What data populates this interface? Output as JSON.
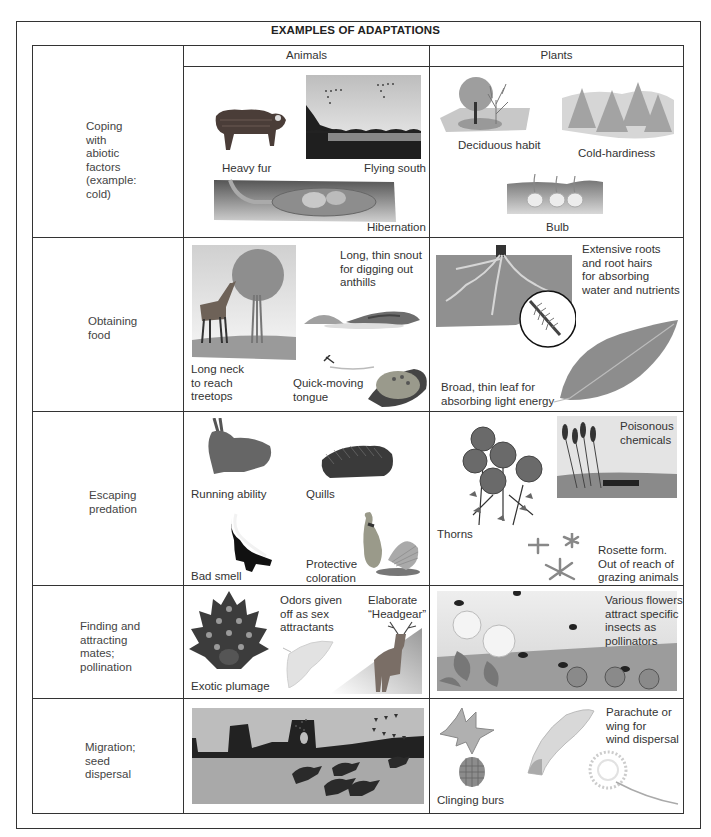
{
  "title": "EXAMPLES OF ADAPTATIONS",
  "columns": {
    "category": "",
    "animals": "Animals",
    "plants": "Plants"
  },
  "rows": [
    {
      "category": "Coping with abiotic factors (example: cold)",
      "category_lines": [
        "Coping",
        "with",
        "abiotic",
        "factors",
        "(example:",
        "cold)"
      ],
      "animals": [
        {
          "caption": "Heavy fur",
          "icon": "musk-ox-illustration"
        },
        {
          "caption": "Flying south",
          "icon": "geese-migrating-illustration"
        },
        {
          "caption": "Hibernation",
          "icon": "burrow-hibernation-illustration"
        }
      ],
      "plants": [
        {
          "caption": "Deciduous habit",
          "icon": "deciduous-trees-illustration"
        },
        {
          "caption": "Cold-hardiness",
          "icon": "conifer-trees-illustration"
        },
        {
          "caption": "Bulb",
          "icon": "bulbs-in-soil-illustration"
        }
      ]
    },
    {
      "category": "Obtaining food",
      "category_lines": [
        "Obtaining",
        "food"
      ],
      "animals": [
        {
          "caption": "Long neck to reach treetops",
          "caption_lines": [
            "Long neck",
            "to reach",
            "treetops"
          ],
          "icon": "giraffe-illustration"
        },
        {
          "caption": "Long, thin snout for digging out anthills",
          "caption_lines": [
            "Long, thin snout",
            "for digging out",
            "anthills"
          ],
          "icon": "anteater-illustration"
        },
        {
          "caption": "Quick-moving tongue",
          "caption_lines": [
            "Quick-moving",
            "tongue"
          ],
          "icon": "frog-tongue-illustration"
        }
      ],
      "plants": [
        {
          "caption": "Extensive roots and root hairs for absorbing water and nutrients",
          "caption_lines": [
            "Extensive roots",
            "and root hairs",
            "for absorbing",
            "water and nutrients"
          ],
          "icon": "roots-illustration"
        },
        {
          "caption": "Broad, thin leaf for absorbing light energy",
          "caption_lines": [
            "Broad, thin leaf for",
            "absorbing light energy"
          ],
          "icon": "leaf-illustration"
        }
      ]
    },
    {
      "category": "Escaping predation",
      "category_lines": [
        "Escaping",
        "predation"
      ],
      "animals": [
        {
          "caption": "Running ability",
          "icon": "rabbit-illustration"
        },
        {
          "caption": "Quills",
          "icon": "porcupine-illustration"
        },
        {
          "caption": "Bad smell",
          "icon": "skunk-illustration"
        },
        {
          "caption": "Protective coloration",
          "caption_lines": [
            "Protective",
            "coloration"
          ],
          "icon": "grouse-illustration"
        }
      ],
      "plants": [
        {
          "caption": "Thorns",
          "icon": "roses-illustration"
        },
        {
          "caption": "Poisonous chemicals",
          "caption_lines": [
            "Poisonous",
            "chemicals"
          ],
          "icon": "cattails-illustration"
        },
        {
          "caption": "Rosette form. Out of reach of grazing animals",
          "caption_lines": [
            "Rosette form.",
            "Out of reach of",
            "grazing animals"
          ],
          "icon": "rosette-illustration"
        }
      ]
    },
    {
      "category": "Finding and attracting mates; pollination",
      "category_lines": [
        "Finding and",
        "attracting",
        "mates;",
        "pollination"
      ],
      "animals": [
        {
          "caption": "Exotic plumage",
          "icon": "peacock-illustration"
        },
        {
          "caption": "Odors given off as sex attractants",
          "caption_lines": [
            "Odors given",
            "off as sex",
            "attractants"
          ],
          "icon": "moth-illustration"
        },
        {
          "caption": "Elaborate “Headgear”",
          "caption_lines": [
            "Elaborate",
            "“Headgear”"
          ],
          "icon": "deer-illustration"
        }
      ],
      "plants": [
        {
          "caption": "Various flowers attract specific insects as pollinators",
          "caption_lines": [
            "Various flowers",
            "attract specific",
            "insects as",
            "pollinators"
          ],
          "icon": "flowers-bees-illustration"
        }
      ]
    },
    {
      "category": "Migration; seed dispersal",
      "category_lines": [
        "Migration;",
        "seed",
        "dispersal"
      ],
      "animals": [
        {
          "caption": "",
          "icon": "horses-geese-migration-illustration"
        }
      ],
      "plants": [
        {
          "caption": "Clinging burs",
          "icon": "burs-illustration"
        },
        {
          "caption": "Parachute or wing for wind dispersal",
          "caption_lines": [
            "Parachute or",
            "wing for",
            "wind dispersal"
          ],
          "icon": "seed-wing-dandelion-illustration"
        }
      ]
    }
  ],
  "colors": {
    "border": "#333333",
    "text": "#333333",
    "illustration_gray": "#8a8a8a"
  }
}
